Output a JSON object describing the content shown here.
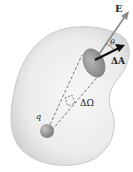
{
  "diagram": {
    "labels": {
      "field": "E",
      "angle": "θ",
      "area_element": "ΔA",
      "solid_angle": "ΔΩ",
      "charge": "q"
    },
    "colors": {
      "surface_fill": "#e9e9e9",
      "surface_edge": "#c9c9c9",
      "patch": "#9a9a9a",
      "charge": "#8f8f8f",
      "e_arrow": "#8a8a8a",
      "da_arrow": "#111111",
      "dash": "#555555"
    }
  }
}
